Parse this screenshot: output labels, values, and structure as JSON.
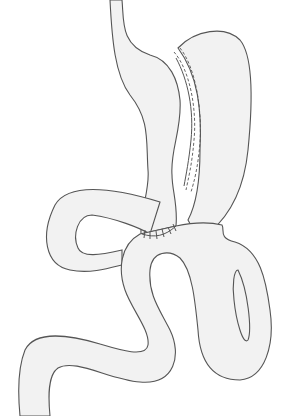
{
  "figure": {
    "title": "",
    "parts": [
      "esophagus",
      "gastric-pouch",
      "remnant-stomach",
      "staple-line",
      "gastrojejunal-anastomosis",
      "roux-limb",
      "biliopancreatic-limb",
      "common-channel"
    ],
    "colors": {
      "fill": "#f2f2f2",
      "stroke": "#555555",
      "background": "#ffffff"
    }
  }
}
